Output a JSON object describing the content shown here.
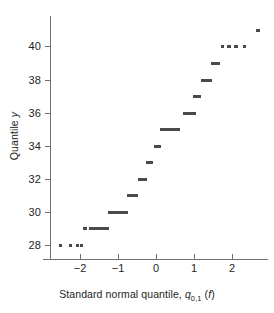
{
  "figure": {
    "name": "normal-quantile-quantile-plot",
    "background_color": "#ffffff",
    "marker_color": "#4a4a4a",
    "axis_color": "#6f6f6f",
    "text_color": "#242424"
  },
  "axes": {
    "x": {
      "title_prefix": "Standard normal quantile, ",
      "title_symbol": "q",
      "title_subscript": "0,1",
      "title_suffix_open": " (",
      "title_arg": "f",
      "title_suffix_close": ")",
      "title_plain": "Standard normal quantile, q0,1 (f)",
      "ticks": [
        -2,
        -1,
        0,
        1,
        2
      ],
      "tick_labels": [
        "−2",
        "−1",
        "0",
        "1",
        "2"
      ],
      "range": [
        -2.95,
        2.95
      ]
    },
    "y": {
      "title_prefix": "Quantile ",
      "title_symbol": "y",
      "title_plain": "Quantile y",
      "ticks": [
        28,
        30,
        32,
        34,
        36,
        38,
        40
      ],
      "tick_labels": [
        "28",
        "30",
        "32",
        "34",
        "36",
        "38",
        "40"
      ],
      "range": [
        27.45,
        41.45
      ]
    }
  },
  "chart_data": {
    "type": "scatter",
    "title": "",
    "xlabel": "Standard normal quantile, q0,1 (f)",
    "ylabel": "Quantile y",
    "xlim": [
      -2.95,
      2.95
    ],
    "ylim": [
      27.45,
      41.45
    ],
    "grid": false,
    "legend": "none",
    "x_ticks": [
      -2,
      -1,
      0,
      1,
      2
    ],
    "y_ticks": [
      28,
      30,
      32,
      34,
      36,
      38,
      40
    ],
    "points": [
      {
        "x": -2.52,
        "y": 28
      },
      {
        "x": -2.25,
        "y": 28
      },
      {
        "x": -2.07,
        "y": 28
      },
      {
        "x": -1.96,
        "y": 28
      },
      {
        "x": -1.87,
        "y": 29
      },
      {
        "x": -1.72,
        "y": 29
      },
      {
        "x": -1.64,
        "y": 29
      },
      {
        "x": -1.56,
        "y": 29
      },
      {
        "x": -1.49,
        "y": 29
      },
      {
        "x": -1.42,
        "y": 29
      },
      {
        "x": -1.35,
        "y": 29
      },
      {
        "x": -1.29,
        "y": 29
      },
      {
        "x": -1.23,
        "y": 30
      },
      {
        "x": -1.17,
        "y": 30
      },
      {
        "x": -1.11,
        "y": 30
      },
      {
        "x": -1.05,
        "y": 30
      },
      {
        "x": -0.99,
        "y": 30
      },
      {
        "x": -0.94,
        "y": 30
      },
      {
        "x": -0.88,
        "y": 30
      },
      {
        "x": -0.83,
        "y": 30
      },
      {
        "x": -0.78,
        "y": 30
      },
      {
        "x": -0.72,
        "y": 31
      },
      {
        "x": -0.67,
        "y": 31
      },
      {
        "x": -0.62,
        "y": 31
      },
      {
        "x": -0.57,
        "y": 31
      },
      {
        "x": -0.52,
        "y": 31
      },
      {
        "x": -0.43,
        "y": 32
      },
      {
        "x": -0.38,
        "y": 32
      },
      {
        "x": -0.33,
        "y": 32
      },
      {
        "x": -0.28,
        "y": 32
      },
      {
        "x": -0.22,
        "y": 33
      },
      {
        "x": -0.17,
        "y": 33
      },
      {
        "x": -0.12,
        "y": 33
      },
      {
        "x": -0.02,
        "y": 34
      },
      {
        "x": 0.03,
        "y": 34
      },
      {
        "x": 0.08,
        "y": 34
      },
      {
        "x": 0.16,
        "y": 35
      },
      {
        "x": 0.22,
        "y": 35
      },
      {
        "x": 0.28,
        "y": 35
      },
      {
        "x": 0.34,
        "y": 35
      },
      {
        "x": 0.4,
        "y": 35
      },
      {
        "x": 0.46,
        "y": 35
      },
      {
        "x": 0.52,
        "y": 35
      },
      {
        "x": 0.58,
        "y": 35
      },
      {
        "x": 0.74,
        "y": 36
      },
      {
        "x": 0.8,
        "y": 36
      },
      {
        "x": 0.86,
        "y": 36
      },
      {
        "x": 0.93,
        "y": 36
      },
      {
        "x": 1.0,
        "y": 36
      },
      {
        "x": 1.02,
        "y": 37
      },
      {
        "x": 1.08,
        "y": 37
      },
      {
        "x": 1.15,
        "y": 37
      },
      {
        "x": 1.22,
        "y": 38
      },
      {
        "x": 1.29,
        "y": 38
      },
      {
        "x": 1.36,
        "y": 38
      },
      {
        "x": 1.43,
        "y": 38
      },
      {
        "x": 1.49,
        "y": 39
      },
      {
        "x": 1.57,
        "y": 39
      },
      {
        "x": 1.65,
        "y": 39
      },
      {
        "x": 1.75,
        "y": 40
      },
      {
        "x": 1.92,
        "y": 40
      },
      {
        "x": 2.1,
        "y": 40
      },
      {
        "x": 2.32,
        "y": 40
      },
      {
        "x": 2.68,
        "y": 41
      }
    ]
  }
}
